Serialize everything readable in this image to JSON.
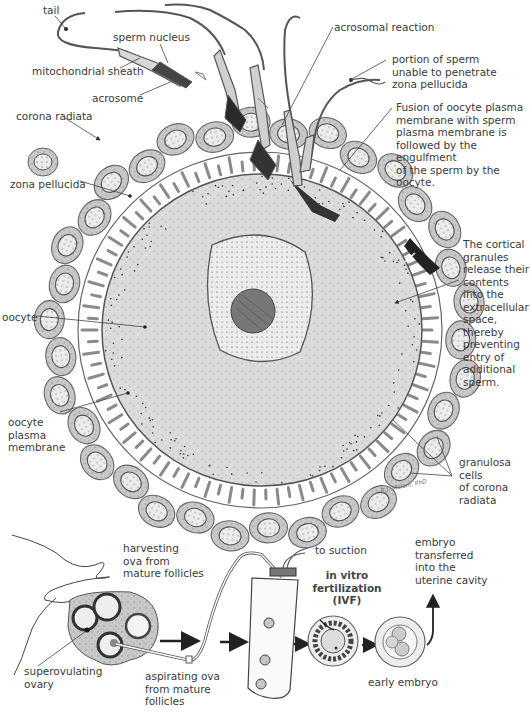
{
  "diagram": {
    "top_section": {
      "subject": "fertilization of oocyte by sperm",
      "labels": {
        "tail": "tail",
        "sperm_nucleus": "sperm nucleus",
        "mitochondrial_sheath": "mitochondrial sheath",
        "acrosome": "acrosome",
        "corona_radiata": "corona radiata",
        "zona_pellucida": "zona pellucida",
        "oocyte": "oocyte",
        "oocyte_plasma_membrane": "oocyte\nplasma\nmembrane",
        "acrosomal_reaction": "acrosomal reaction",
        "portion_of_sperm": "portion of sperm\nunable to penetrate\nzona pellucida",
        "fusion": "Fusion of oocyte plasma\nmembrane with sperm\nplasma membrane is\nfollowed by the engulfment\nof the sperm by the oocyte.",
        "cortical_granules": "The cortical\ngranules\nrelease their\ncontents\ninto the\nextracellular\nspace,\nthereby\npreventing\nentry of\nadditional\nsperm.",
        "granulosa_cells": "granulosa cells\nof corona\nradiata"
      },
      "signature": "B.J. Meloni, PhD"
    },
    "bottom_section": {
      "subject": "in vitro fertilization process",
      "labels": {
        "harvesting": "harvesting\nova from\nmature follicles",
        "superovulating_ovary": "superovulating\novary",
        "aspirating": "aspirating ova\nfrom mature\nfollicles",
        "to_suction": "to suction",
        "ivf_title": "in vitro\nfertilization\n(IVF)",
        "early_embryo": "early embryo",
        "embryo_transferred": "embryo\ntransferred\ninto the\nuterine cavity"
      }
    },
    "colors": {
      "line": "#444444",
      "cell_fill": "#cfcfcf",
      "cell_edge": "#6a6a6a",
      "oocyte_fill": "#dedede",
      "nucleus_fill": "#f1f1f1",
      "nucleolus_fill": "#7a7a7a",
      "zona_fill": "#ffffff"
    }
  }
}
